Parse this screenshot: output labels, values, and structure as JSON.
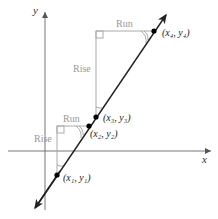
{
  "diagram": {
    "axes": {
      "x_label": "x",
      "y_label": "y"
    },
    "points": [
      {
        "id": "p1",
        "label": "(x₁, y₁)",
        "label_html": [
          "x",
          "1",
          "y",
          "1"
        ]
      },
      {
        "id": "p2",
        "label": "(x₂, y₂)"
      },
      {
        "id": "p3",
        "label": "(x₃, y₃)"
      },
      {
        "id": "p4",
        "label": "(x₄, y₄)"
      }
    ],
    "triangles": [
      {
        "id": "large",
        "rise_label": "Rise",
        "run_label": "Run"
      },
      {
        "id": "small",
        "rise_label": "Rise",
        "run_label": "Run"
      }
    ],
    "colors": {
      "line": "#222222",
      "axes": "#555555",
      "triangle": "#aaaaaa",
      "label_gray": "#999999"
    }
  }
}
